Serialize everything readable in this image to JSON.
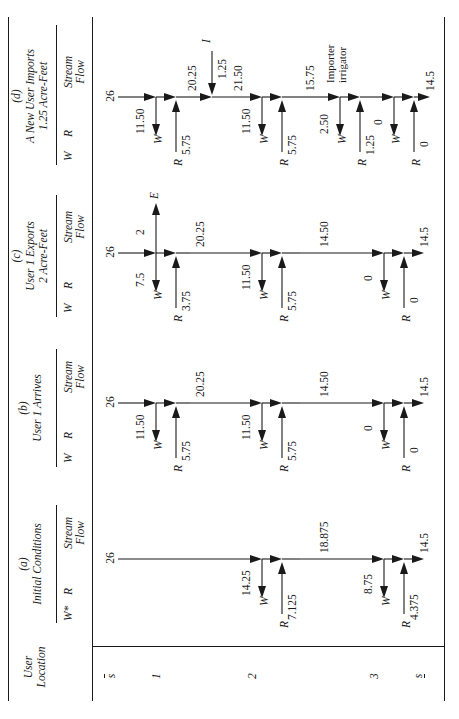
{
  "figure": {
    "row_header_title_line1": "User",
    "row_header_title_line2": "Location",
    "subheader_stream_line1": "Stream",
    "subheader_stream_line2": "Flow",
    "w_label": "W",
    "w_star_label": "W*",
    "r_label": "R"
  },
  "locations": [
    {
      "id": "s-upper",
      "label": "s",
      "bar": "over"
    },
    {
      "id": "loc1",
      "label": "1",
      "bar": "none"
    },
    {
      "id": "loc2",
      "label": "2",
      "bar": "none"
    },
    {
      "id": "loc3",
      "label": "3",
      "bar": "none"
    },
    {
      "id": "s-lower",
      "label": "s",
      "bar": "under"
    }
  ],
  "columns": [
    {
      "key": "a",
      "tag": "(a)",
      "title_line1": "Initial Conditions",
      "title_line2": "",
      "w_header": "W*",
      "r_header": "R",
      "stream_header_line1": "Stream",
      "stream_header_line2": "Flow",
      "inflow": "26",
      "nodes": [
        {
          "location": "1",
          "w": "",
          "r": "",
          "outflow": "",
          "active": false
        },
        {
          "location": "2",
          "w": "14.25",
          "r": "7.125",
          "outflow": "18.875",
          "active": true
        },
        {
          "location": "3",
          "w": "8.75",
          "r": "4.375",
          "outflow": "14.5",
          "active": true
        }
      ],
      "extra": []
    },
    {
      "key": "b",
      "tag": "(b)",
      "title_line1": "User 1 Arrives",
      "title_line2": "",
      "w_header": "W",
      "r_header": "R",
      "stream_header_line1": "Stream",
      "stream_header_line2": "Flow",
      "inflow": "26",
      "nodes": [
        {
          "location": "1",
          "w": "11.50",
          "r": "5.75",
          "outflow": "20.25",
          "active": true
        },
        {
          "location": "2",
          "w": "11.50",
          "r": "5.75",
          "outflow": "14.50",
          "active": true
        },
        {
          "location": "3",
          "w": "0",
          "r": "0",
          "outflow": "14.5",
          "active": true
        }
      ],
      "extra": []
    },
    {
      "key": "c",
      "tag": "(c)",
      "title_line1": "User 1 Exports",
      "title_line2": "2 Acre-Feet",
      "w_header": "W",
      "r_header": "R",
      "stream_header_line1": "Stream",
      "stream_header_line2": "Flow",
      "inflow": "26",
      "nodes": [
        {
          "location": "1",
          "w": "7.5",
          "r": "3.75",
          "outflow": "20.25",
          "active": true
        },
        {
          "location": "2",
          "w": "11.50",
          "r": "5.75",
          "outflow": "14.50",
          "active": true
        },
        {
          "location": "3",
          "w": "0",
          "r": "0",
          "outflow": "14.5",
          "active": true
        }
      ],
      "extra": [
        {
          "kind": "export",
          "value": "2",
          "symbol": "E",
          "at_location": "1"
        }
      ]
    },
    {
      "key": "d",
      "tag": "(d)",
      "title_line1": "A New User Imports",
      "title_line2": "1.25 Acre-Feet",
      "w_header": "W",
      "r_header": "R",
      "stream_header_line1": "Stream",
      "stream_header_line2": "Flow",
      "inflow": "26",
      "nodes": [
        {
          "location": "1",
          "w": "11.50",
          "r": "5.75",
          "outflow": "20.25",
          "active": true
        },
        {
          "location": "2",
          "w": "11.50",
          "r": "5.75",
          "outflow": "15.75",
          "active": true
        },
        {
          "location": "3",
          "w": "2.50",
          "r": "1.25",
          "outflow": "14.5",
          "active": true
        }
      ],
      "mid_flow_after_import": "21.50",
      "extra": [
        {
          "kind": "import",
          "value": "1.25",
          "symbol": "I",
          "at_location": "between-1-and-2"
        },
        {
          "kind": "annotation",
          "line1": "Importer",
          "line2": "irrigator",
          "at_location": "3"
        },
        {
          "kind": "zero-node",
          "w": "0",
          "r": "0",
          "outflow": "14.5"
        }
      ]
    }
  ]
}
